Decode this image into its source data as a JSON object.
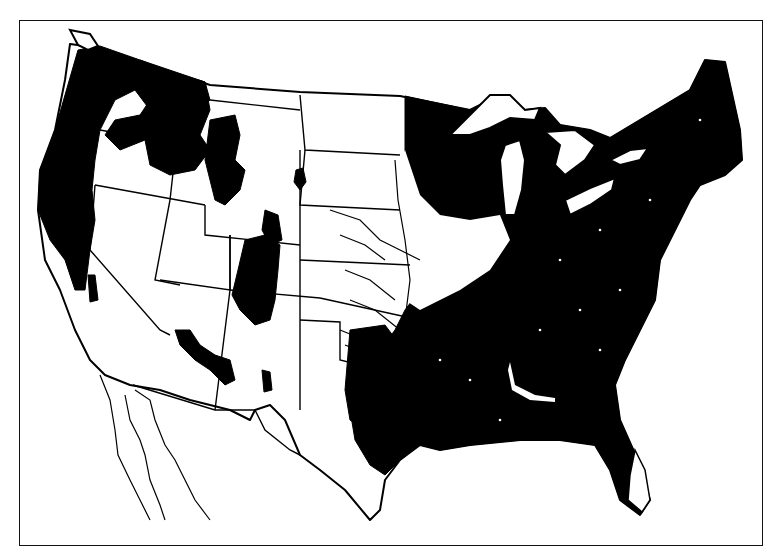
{
  "map": {
    "subject": "contiguous-united-states-forest-cover",
    "style": "black-and-white scanned map",
    "colors": {
      "forest": "#000000",
      "land": "#ffffff",
      "border": "#000000",
      "background": "#ffffff"
    },
    "regions_shaded": [
      "pacific-northwest",
      "northern-rockies",
      "central-rockies",
      "southwest-highlands",
      "eastern-united-states"
    ],
    "water_bodies_shown": [
      "lake-superior",
      "lake-michigan",
      "lake-huron",
      "lake-erie",
      "lake-ontario",
      "gulf-of-california",
      "puget-sound"
    ]
  }
}
